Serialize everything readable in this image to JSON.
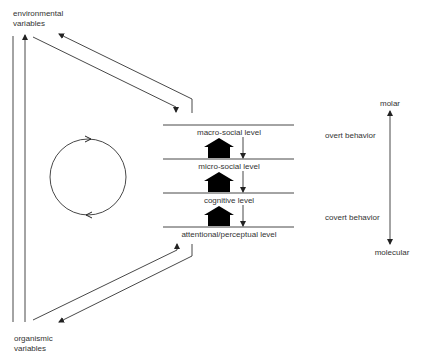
{
  "diagram": {
    "inputs": {
      "environmental": [
        "environmental",
        "variables"
      ],
      "organismic": [
        "organismic",
        "variables"
      ]
    },
    "levels": [
      {
        "label": "macro-social level"
      },
      {
        "label": "micro-social level"
      },
      {
        "label": "cognitive level"
      },
      {
        "label": "attentional/perceptual level"
      }
    ],
    "behavior_labels": {
      "overt": "overt behavior",
      "covert": "covert behavior"
    },
    "scale": {
      "top": "molar",
      "bottom": "molecular"
    },
    "colors": {
      "line": "#333333",
      "fill": "#000000",
      "background": "#ffffff"
    }
  }
}
